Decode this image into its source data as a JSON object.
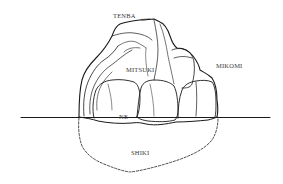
{
  "diagram": {
    "labels": {
      "tenba": "TENBA",
      "mitsuki": "MITSUKI",
      "mikomi": "MIKOMI",
      "ne": "NE",
      "shiki": "SHIKI"
    },
    "colors": {
      "ink": "#1a1a1a",
      "label": "#3a3a3a",
      "background": "#ffffff"
    }
  }
}
